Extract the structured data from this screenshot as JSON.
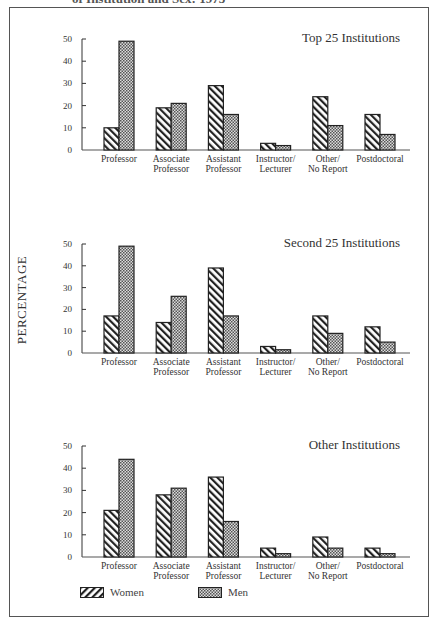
{
  "caption": "of Institution and Sex: 1973",
  "y_axis_label": "PERCENTAGE",
  "legend": [
    {
      "label": "Women",
      "pattern": "hatch"
    },
    {
      "label": "Men",
      "pattern": "checker"
    }
  ],
  "colors": {
    "outline": "#222222",
    "hatch": "#222222",
    "checker_dark": "#555555",
    "checker_light": "#dddddd",
    "frame": "#555555"
  },
  "chart_data": [
    {
      "type": "bar",
      "title": "Top 25 Institutions",
      "categories": [
        "Professor",
        "Associate Professor",
        "Assistant Professor",
        "Instructor/ Lecturer",
        "Other/ No Report",
        "Postdoctoral"
      ],
      "series": [
        {
          "name": "Women",
          "values": [
            10,
            19,
            29,
            3,
            24,
            16
          ]
        },
        {
          "name": "Men",
          "values": [
            49,
            21,
            16,
            2,
            11,
            7
          ]
        }
      ],
      "xlabel": "",
      "ylabel": "PERCENTAGE",
      "ylim": [
        0,
        50
      ],
      "yticks": [
        0,
        10,
        20,
        30,
        40,
        50
      ],
      "grid": false,
      "legend_position": "bottom"
    },
    {
      "type": "bar",
      "title": "Second 25 Institutions",
      "categories": [
        "Professor",
        "Associate Professor",
        "Assistant Professor",
        "Instructor/ Lecturer",
        "Other/ No Report",
        "Postdoctoral"
      ],
      "series": [
        {
          "name": "Women",
          "values": [
            17,
            14,
            39,
            3,
            17,
            12
          ]
        },
        {
          "name": "Men",
          "values": [
            49,
            26,
            17,
            1.5,
            9,
            5
          ]
        }
      ],
      "xlabel": "",
      "ylabel": "PERCENTAGE",
      "ylim": [
        0,
        50
      ],
      "yticks": [
        0,
        10,
        20,
        30,
        40,
        50
      ],
      "grid": false,
      "legend_position": "bottom"
    },
    {
      "type": "bar",
      "title": "Other Institutions",
      "categories": [
        "Professor",
        "Associate Professor",
        "Assistant Professor",
        "Instructor/ Lecturer",
        "Other/ No Report",
        "Postdoctoral"
      ],
      "series": [
        {
          "name": "Women",
          "values": [
            21,
            28,
            36,
            4,
            9,
            4
          ]
        },
        {
          "name": "Men",
          "values": [
            44,
            31,
            16,
            1.5,
            4,
            1.5
          ]
        }
      ],
      "xlabel": "",
      "ylabel": "PERCENTAGE",
      "ylim": [
        0,
        50
      ],
      "yticks": [
        0,
        10,
        20,
        30,
        40,
        50
      ],
      "grid": false,
      "legend_position": "bottom"
    }
  ],
  "panels_layout": [
    {
      "top_y": 39,
      "zero_y": 150
    },
    {
      "top_y": 244,
      "zero_y": 353
    },
    {
      "top_y": 446,
      "zero_y": 557
    }
  ]
}
